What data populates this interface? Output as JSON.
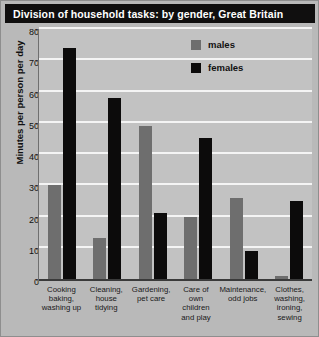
{
  "chart_data": {
    "type": "bar",
    "title": "Division of household tasks: by gender, Great Britain",
    "xlabel": "",
    "ylabel": "Minutes per person per day",
    "ylim": [
      0,
      80
    ],
    "ytick_step": 10,
    "yticks": [
      80,
      70,
      60,
      50,
      40,
      30,
      20,
      10,
      0
    ],
    "grid": true,
    "legend_position": "top-right",
    "categories": [
      "Cooking\nbaking,\nwashing up",
      "Cleaning,\nhouse\ntidying",
      "Gardening,\npet care",
      "Care of\nown children\nand play",
      "Maintenance,\nodd jobs",
      "Clothes,\nwashing,\nironing,\nsewing"
    ],
    "series": [
      {
        "name": "males",
        "color": "#6e6e6e",
        "values": [
          30,
          13,
          49,
          20,
          26,
          1
        ]
      },
      {
        "name": "females",
        "color": "#0c0b0b",
        "values": [
          74,
          58,
          21,
          45,
          9,
          25
        ]
      }
    ]
  },
  "colors": {
    "title_banner_bg": "#100f0f",
    "title_text": "#ffffff",
    "figure_bg": "#b9b9b9",
    "plot_bg": "#c2c2c2",
    "gridline": "#f4f4f4",
    "axis": "#3a3a3a"
  }
}
